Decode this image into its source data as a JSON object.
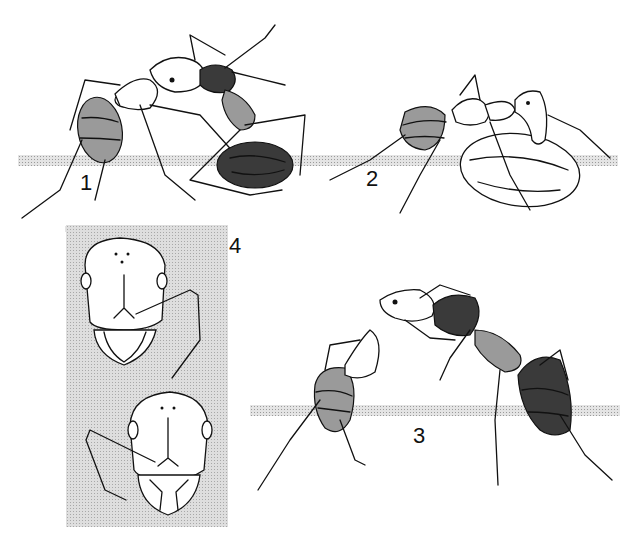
{
  "plate": {
    "description": "Scientific illustration plate of ant behaviour, four numbered figures",
    "colors": {
      "ink": "#111111",
      "stipple": "#a0a0a0",
      "background": "#ffffff"
    }
  },
  "figures": [
    {
      "number": "1",
      "subject": "ant carrying another ant"
    },
    {
      "number": "2",
      "subject": "ant carrying a large seed/food item"
    },
    {
      "number": "3",
      "subject": "two ants facing each other, mouth-to-mouth exchange"
    },
    {
      "number": "4",
      "subject": "two frontal head views (upper and lower)"
    }
  ]
}
